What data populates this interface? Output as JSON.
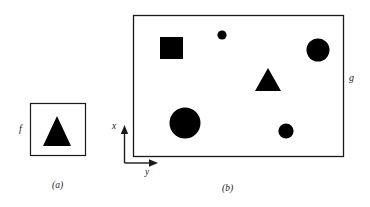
{
  "figure": {
    "caption_a": "(a)",
    "caption_b": "(b)",
    "label_f": "f",
    "label_g": "g",
    "axis_x_label": "x",
    "axis_y_label": "y",
    "stroke_color": "#1a1a1a",
    "fill_color": "#000000",
    "background_color": "#ffffff"
  },
  "panel_a": {
    "name": "f",
    "frame": {
      "x": 30,
      "y": 103,
      "width": 55,
      "height": 52
    },
    "shapes": [
      {
        "type": "triangle",
        "cx": 57,
        "base_y": 146,
        "apex_y": 116,
        "half_width": 14
      }
    ]
  },
  "panel_b": {
    "name": "g",
    "frame": {
      "x": 133,
      "y": 15,
      "width": 211,
      "height": 142
    },
    "shapes": [
      {
        "type": "square",
        "x": 160,
        "y": 37,
        "size": 23
      },
      {
        "type": "circle",
        "cx": 222,
        "cy": 35,
        "r": 4.5
      },
      {
        "type": "circle",
        "cx": 318,
        "cy": 50,
        "r": 11.5
      },
      {
        "type": "triangle",
        "cx": 268,
        "base_y": 91,
        "apex_y": 68,
        "half_width": 13
      },
      {
        "type": "circle",
        "cx": 185,
        "cy": 123,
        "r": 15.5
      },
      {
        "type": "circle",
        "cx": 286,
        "cy": 131,
        "r": 7.5
      }
    ],
    "axes": {
      "origin": {
        "x": 124,
        "y": 163
      },
      "x_axis_tip": {
        "x": 124,
        "y": 126
      },
      "y_axis_tip": {
        "x": 158,
        "y": 163
      }
    }
  }
}
